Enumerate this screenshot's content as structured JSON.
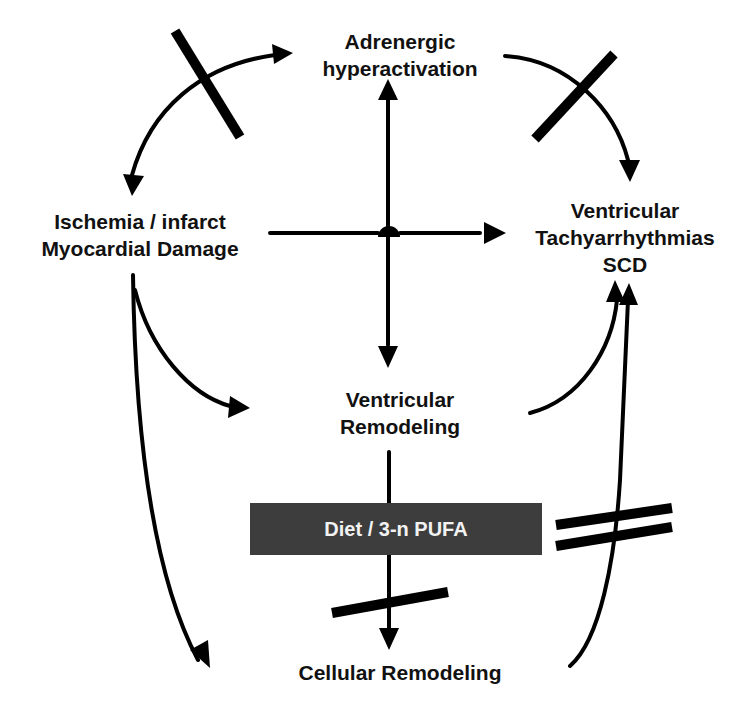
{
  "nodes": {
    "adrenergic": {
      "line1": "Adrenergic",
      "line2": "hyperactivation"
    },
    "ischemia": {
      "line1": "Ischemia / infarct",
      "line2": "Myocardial Damage"
    },
    "ventricular_tachy": {
      "line1": "Ventricular",
      "line2": "Tachyarrhythmias",
      "line3": "SCD"
    },
    "ventricular_remodeling": {
      "line1": "Ventricular",
      "line2": "Remodeling"
    },
    "cellular_remodeling": {
      "line1": "Cellular Remodeling"
    }
  },
  "intervention": {
    "label": "Diet / 3-n PUFA",
    "fill": "#3d3d3d",
    "text_color": "#f2f2f2"
  },
  "edges": [
    {
      "from": "ischemia",
      "to": "adrenergic",
      "bidirectional": true,
      "blocked": true,
      "block_style": "single-bar"
    },
    {
      "from": "adrenergic",
      "to": "ventricular_tachy",
      "blocked": true,
      "block_style": "single-bar"
    },
    {
      "from": "ischemia",
      "to": "ventricular_tachy",
      "via": "central-junction"
    },
    {
      "from": "adrenergic",
      "to": "ventricular_remodeling",
      "bidirectional": true,
      "via": "central-junction"
    },
    {
      "from": "ischemia",
      "to": "ventricular_remodeling"
    },
    {
      "from": "ischemia",
      "to": "cellular_remodeling"
    },
    {
      "from": "ventricular_remodeling",
      "to": "ventricular_tachy"
    },
    {
      "from": "ventricular_remodeling",
      "to": "cellular_remodeling",
      "through": "intervention",
      "blocked": true,
      "block_style": "single-bar"
    },
    {
      "from": "cellular_remodeling",
      "to": "ventricular_tachy",
      "blocked": true,
      "block_style": "double-bar"
    }
  ]
}
